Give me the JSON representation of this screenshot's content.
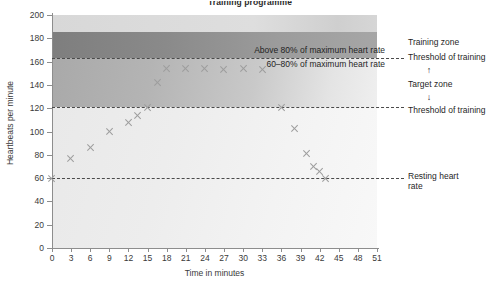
{
  "chart_data": {
    "type": "scatter",
    "title": "Training programme",
    "xlabel": "Time in minutes",
    "ylabel": "Heartbeats per minute",
    "xlim": [
      0,
      51
    ],
    "ylim": [
      0,
      200
    ],
    "xticks": [
      0,
      3,
      6,
      9,
      12,
      15,
      18,
      21,
      24,
      27,
      30,
      33,
      36,
      39,
      42,
      45,
      48,
      51
    ],
    "yticks": [
      0,
      20,
      40,
      60,
      80,
      100,
      120,
      140,
      160,
      180,
      200
    ],
    "grid": false,
    "legend": "none",
    "series": [
      {
        "name": "Heart rate during training session",
        "marker": "x",
        "color": "#9d9d9d",
        "points": [
          {
            "x": 0,
            "y": 60
          },
          {
            "x": 3,
            "y": 77
          },
          {
            "x": 6,
            "y": 86
          },
          {
            "x": 9,
            "y": 100
          },
          {
            "x": 12,
            "y": 108
          },
          {
            "x": 13.5,
            "y": 114
          },
          {
            "x": 15,
            "y": 121
          },
          {
            "x": 16.5,
            "y": 142
          },
          {
            "x": 18,
            "y": 154
          },
          {
            "x": 21,
            "y": 154
          },
          {
            "x": 24,
            "y": 154
          },
          {
            "x": 27,
            "y": 153
          },
          {
            "x": 30,
            "y": 154
          },
          {
            "x": 33,
            "y": 153
          },
          {
            "x": 36,
            "y": 121
          },
          {
            "x": 38,
            "y": 103
          },
          {
            "x": 40,
            "y": 81
          },
          {
            "x": 41,
            "y": 70
          },
          {
            "x": 42,
            "y": 66
          },
          {
            "x": 43,
            "y": 60
          }
        ]
      }
    ],
    "reference_lines": [
      {
        "value": 163,
        "label": "Threshold of training",
        "style": "dashed"
      },
      {
        "value": 121,
        "label": "Threshold of training",
        "style": "dashed"
      },
      {
        "value": 60,
        "label": "Resting heart rate",
        "style": "dashed"
      }
    ],
    "zones": [
      {
        "label": "Above 80% of maximum heart rate",
        "from": 163,
        "to": 185,
        "shade": "dark"
      },
      {
        "label": "60–80% of maximum heart rate",
        "from": 121,
        "to": 163,
        "shade": "medium"
      }
    ],
    "annotations": [
      {
        "text": "Above 80% of maximum heart rate",
        "at_y": 170
      },
      {
        "text": "60–80% of maximum heart rate",
        "at_y": 158
      }
    ]
  },
  "side_labels": {
    "training_zone": "Training zone",
    "threshold_upper": "Threshold of training",
    "target_zone": "Target zone",
    "threshold_lower": "Threshold of training",
    "resting_heart_rate": "Resting heart\nrate",
    "arrow_up": "↑",
    "arrow_down": "↓"
  },
  "colors": {
    "marker": "#9d9d9d",
    "axis": "#8d8d8d",
    "dash": "#4a4a4a",
    "band_dark": "#8e8e8e",
    "band_medium": "#b9b9b9",
    "band_light": "#ededed",
    "band_top": "#d8d8d8",
    "text": "#1f1f1f"
  }
}
